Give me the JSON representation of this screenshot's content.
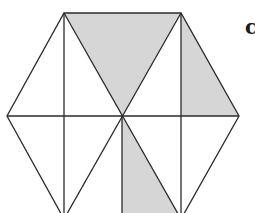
{
  "figure": {
    "label": "c",
    "colors": {
      "stroke": "#2a2a2a",
      "shade": "#d6d6d6",
      "background": "#ffffff"
    },
    "hexagon_vertices": [
      [
        64,
        13
      ],
      [
        181,
        13
      ],
      [
        239,
        116
      ],
      [
        181,
        219
      ],
      [
        64,
        219
      ],
      [
        7,
        116
      ]
    ],
    "center": [
      122,
      116
    ],
    "shaded_regions": [
      {
        "name": "top-center-triangle",
        "points": [
          [
            64,
            13
          ],
          [
            181,
            13
          ],
          [
            122,
            116
          ]
        ]
      },
      {
        "name": "upper-right-triangle",
        "points": [
          [
            181,
            13
          ],
          [
            239,
            116
          ],
          [
            181,
            116
          ]
        ]
      },
      {
        "name": "bottom-center-triangle",
        "points": [
          [
            122,
            116
          ],
          [
            122,
            219
          ],
          [
            181,
            219
          ]
        ]
      }
    ]
  }
}
